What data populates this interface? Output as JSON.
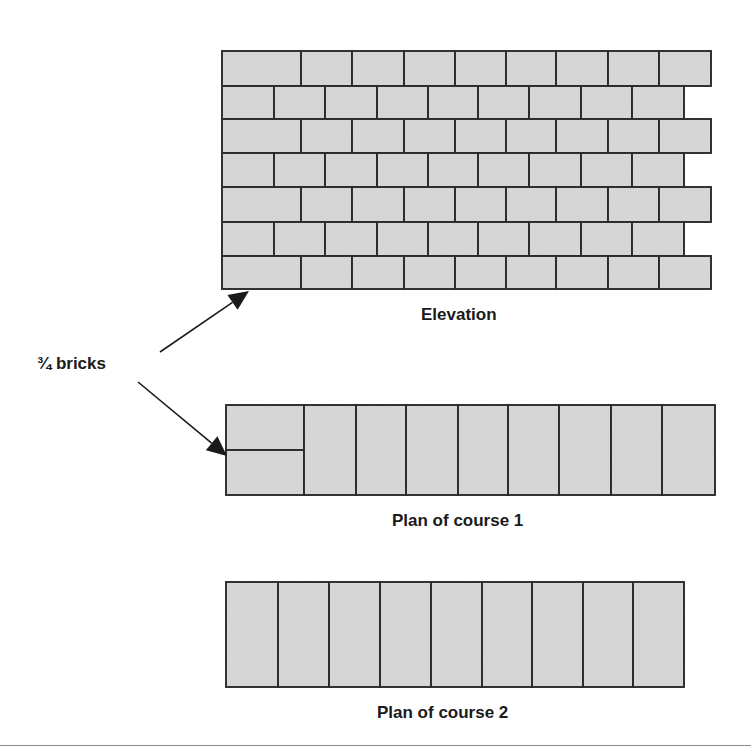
{
  "figure": {
    "labels": {
      "three_quarter_bricks": "¾ bricks",
      "elevation": "Elevation",
      "plan_course_1": "Plan of course 1",
      "plan_course_2": "Plan of course 2"
    },
    "colors": {
      "brick_fill": "#d6d6d6",
      "mortar_line": "#2b2b2b",
      "arrow": "#1a1a1a",
      "rule": "#8a8a8a"
    },
    "elevation": {
      "left": 222,
      "row_tops": [
        51,
        86,
        119,
        153,
        187,
        222,
        256,
        289
      ],
      "odd_row_joints": [
        222,
        301,
        352,
        404,
        455,
        506,
        556,
        608,
        659,
        711
      ],
      "even_row_joints": [
        222,
        274,
        325,
        377,
        428,
        478,
        529,
        581,
        632,
        684
      ]
    },
    "plan_course_1": {
      "top": 405,
      "bottom": 495,
      "joints": [
        226,
        304,
        356,
        406,
        458,
        508,
        559,
        611,
        662,
        715
      ],
      "three_quarter_split_y": 450
    },
    "plan_course_2": {
      "top": 582,
      "bottom": 687,
      "joints": [
        226,
        278,
        329,
        380,
        431,
        482,
        532,
        583,
        633,
        684
      ]
    },
    "arrows": [
      {
        "from": [
          160,
          352
        ],
        "to": [
          249,
          291
        ]
      },
      {
        "from": [
          138,
          382
        ],
        "to": [
          227,
          456
        ]
      }
    ]
  }
}
